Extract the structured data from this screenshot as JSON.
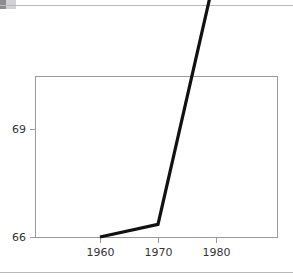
{
  "figure": {
    "background_color": "#ffffff",
    "frame_color": "#9a9a9e",
    "line_color": "#111111",
    "text_color": "#333336",
    "rule_color": "#b9b9bb"
  },
  "chart_data": {
    "type": "line",
    "title": "",
    "xlabel": "",
    "ylabel": "",
    "x": [
      1960,
      1970,
      1980
    ],
    "values": [
      66.0,
      66.35,
      73.4
    ],
    "series": [
      {
        "name": "",
        "values": [
          66.0,
          66.35,
          73.4
        ]
      }
    ],
    "xticks": [
      1960,
      1970,
      1980
    ],
    "xtick_labels": [
      "1960",
      "1970",
      "1980"
    ],
    "yticks": [
      66,
      69
    ],
    "ytick_labels": [
      "66",
      "69"
    ],
    "xlim": [
      1955,
      1986
    ],
    "ylim": [
      66.0,
      70.5
    ],
    "grid": false,
    "legend": null
  },
  "axis": {
    "y_labels": [
      "69",
      "66"
    ],
    "x_labels": [
      "1960",
      "1970",
      "1980"
    ]
  }
}
